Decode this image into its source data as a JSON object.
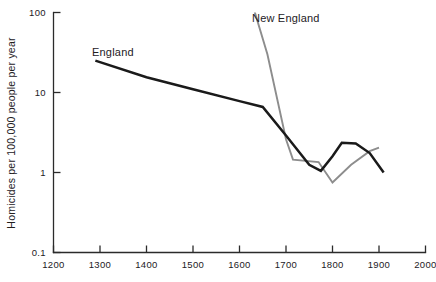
{
  "chart_data": {
    "type": "line",
    "title": "",
    "xlabel": "",
    "ylabel": "Homicides per 100,000 people per year",
    "xlim": [
      1200,
      2000
    ],
    "ylim": [
      0.1,
      100
    ],
    "yscale": "log",
    "grid": false,
    "legend": "inline-labels",
    "xticks": [
      1200,
      1300,
      1400,
      1500,
      1600,
      1700,
      1800,
      1900,
      2000
    ],
    "xtick_labels": [
      "1200",
      "1300",
      "1400",
      "1500",
      "1600",
      "1700",
      "1800",
      "1900",
      "2000"
    ],
    "yticks": [
      0.1,
      1,
      10,
      100
    ],
    "ytick_labels": [
      "0.1",
      "1",
      "10",
      "100"
    ],
    "series": [
      {
        "name": "England",
        "color": "#1a1a1a",
        "label_text": "England",
        "x": [
          1290,
          1400,
          1500,
          1600,
          1650,
          1700,
          1750,
          1775,
          1800,
          1820,
          1850,
          1880,
          1910
        ],
        "y": [
          25,
          15.5,
          11.0,
          7.8,
          6.6,
          2.9,
          1.25,
          1.05,
          1.6,
          2.35,
          2.3,
          1.75,
          1.0
        ]
      },
      {
        "name": "New England",
        "color": "#8d8d8d",
        "label_text": "New England",
        "x": [
          1630,
          1660,
          1700,
          1715,
          1770,
          1800,
          1840,
          1880,
          1900
        ],
        "y": [
          115,
          30,
          2.6,
          1.45,
          1.35,
          0.75,
          1.25,
          1.85,
          2.05
        ]
      }
    ]
  },
  "axis_titles": {
    "y": "Homicides per 100,000 people per year"
  },
  "annotations": [
    {
      "name": "england-label",
      "text": "England"
    },
    {
      "name": "new-england-label",
      "text": "New England"
    }
  ]
}
